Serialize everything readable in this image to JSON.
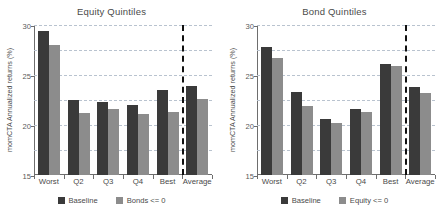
{
  "chart_data": [
    {
      "type": "bar",
      "title": "Equity Quintiles",
      "xlabel": "",
      "ylabel": "momCTA Annualized returns (%)",
      "categories": [
        "Worst",
        "Q2",
        "Q3",
        "Q4",
        "Best",
        "Average"
      ],
      "series": [
        {
          "name": "Baseline",
          "color": "#3a3a3a",
          "values": [
            28.8,
            15.1,
            14.7,
            14.0,
            17.1,
            17.8
          ]
        },
        {
          "name": "Bonds <= 0",
          "color": "#8c8c8c",
          "values": [
            26.1,
            12.4,
            13.2,
            12.3,
            12.6,
            15.2
          ]
        }
      ],
      "ylim": [
        0,
        30
      ],
      "yticks": [
        0,
        5,
        10,
        15,
        20,
        25,
        30
      ],
      "grid": true,
      "legend_position": "bottom",
      "annotations": [
        {
          "type": "vertical-dashed-line",
          "after_category": "Best"
        }
      ]
    },
    {
      "type": "bar",
      "title": "Bond Quintiles",
      "xlabel": "",
      "ylabel": "momCTA Annualized returns (%)",
      "categories": [
        "Worst",
        "Q2",
        "Q3",
        "Q4",
        "Best",
        "Average"
      ],
      "series": [
        {
          "name": "Baseline",
          "color": "#3a3a3a",
          "values": [
            25.6,
            16.6,
            11.3,
            13.3,
            22.3,
            17.7
          ]
        },
        {
          "name": "Equity <= 0",
          "color": "#8c8c8c",
          "values": [
            23.4,
            13.9,
            10.5,
            12.6,
            21.8,
            16.4
          ]
        }
      ],
      "ylim": [
        0,
        30
      ],
      "yticks": [
        0,
        5,
        10,
        15,
        20,
        25,
        30
      ],
      "grid": true,
      "legend_position": "bottom",
      "annotations": [
        {
          "type": "vertical-dashed-line",
          "after_category": "Best"
        }
      ]
    }
  ]
}
